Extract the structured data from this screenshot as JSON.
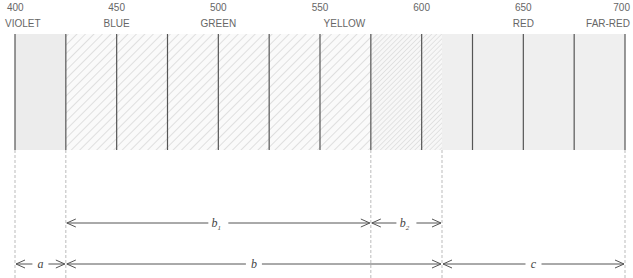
{
  "title": "",
  "axis": {
    "unit": "nm",
    "min": 400,
    "max": 700,
    "ticks": [
      {
        "value": 400,
        "label": "400"
      },
      {
        "value": 450,
        "label": "450"
      },
      {
        "value": 500,
        "label": "500"
      },
      {
        "value": 550,
        "label": "550"
      },
      {
        "value": 600,
        "label": "600"
      },
      {
        "value": 650,
        "label": "650"
      },
      {
        "value": 700,
        "label": "700"
      }
    ]
  },
  "bands": [
    {
      "label": "VIOLET",
      "at": 400,
      "anchor": "start"
    },
    {
      "label": "BLUE",
      "at": 450,
      "anchor": "middle"
    },
    {
      "label": "GREEN",
      "at": 500,
      "anchor": "middle"
    },
    {
      "label": "YELLOW",
      "at": 562,
      "anchor": "middle"
    },
    {
      "label": "RED",
      "at": 650,
      "anchor": "middle"
    },
    {
      "label": "FAR-RED",
      "at": 700,
      "anchor": "end"
    }
  ],
  "regions": [
    {
      "from": 400,
      "to": 425,
      "fill": "solid",
      "color": "#ececec"
    },
    {
      "from": 425,
      "to": 575,
      "fill": "hatch-coarse",
      "color": "#d8d8d8"
    },
    {
      "from": 575,
      "to": 610,
      "fill": "hatch-fine",
      "color": "#d8d8d8"
    },
    {
      "from": 610,
      "to": 700,
      "fill": "solid",
      "color": "#efefef"
    }
  ],
  "dividers": [
    400,
    425,
    450,
    475,
    500,
    525,
    550,
    575,
    600,
    625,
    650,
    675,
    700
  ],
  "guides": [
    400,
    425,
    575,
    610,
    700
  ],
  "spans": [
    {
      "label": "b",
      "subscript": "1",
      "from": 425,
      "to": 575,
      "row": 1
    },
    {
      "label": "b",
      "subscript": "2",
      "from": 575,
      "to": 610,
      "row": 1
    },
    {
      "label": "a",
      "subscript": "",
      "from": 400,
      "to": 425,
      "row": 2
    },
    {
      "label": "b",
      "subscript": "",
      "from": 425,
      "to": 610,
      "row": 2
    },
    {
      "label": "c",
      "subscript": "",
      "from": 610,
      "to": 700,
      "row": 2
    }
  ],
  "colors": {
    "line": "#555555",
    "guide": "#bbbbbb",
    "hatch": "#cfcfcf"
  }
}
